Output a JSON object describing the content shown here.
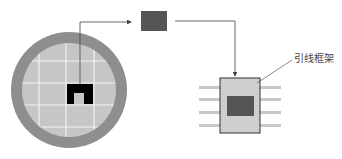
{
  "diagram": {
    "title": "",
    "annotations": {
      "lead_frame_label": "引线框架"
    },
    "colors": {
      "wafer_ring": "#8e8e8e",
      "wafer_surface": "#c6c6c6",
      "grid_lines": "#f2f2f2",
      "selected_die": "#000000",
      "die": "#555555",
      "package_body": "#cfcfcf",
      "package_die": "#555555",
      "leads": "#c8c8c8",
      "arrow": "#444444"
    },
    "components": [
      "wafer",
      "selected-die",
      "separated-die",
      "lead-frame-package"
    ]
  }
}
